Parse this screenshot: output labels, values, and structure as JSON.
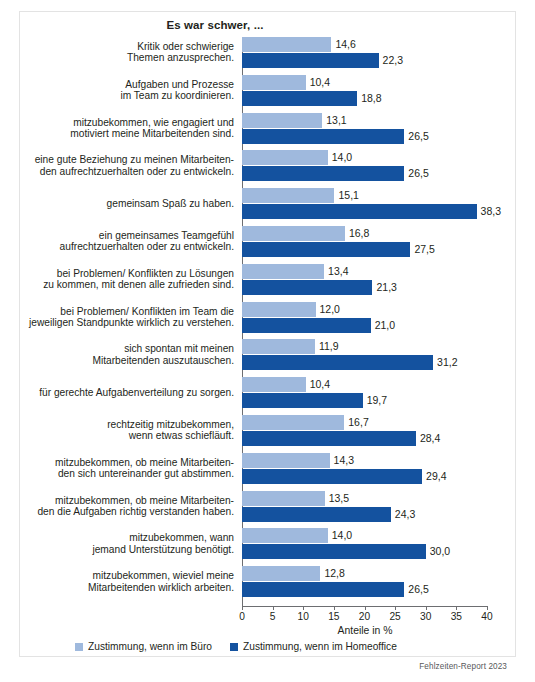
{
  "chart_data": {
    "type": "bar",
    "orientation": "horizontal",
    "title": "Es war schwer, ...",
    "xlabel": "Anteile in %",
    "ylabel": "",
    "xlim": [
      0,
      40
    ],
    "xticks": [
      0,
      5,
      10,
      15,
      20,
      25,
      30,
      35,
      40
    ],
    "grid": false,
    "legend_position": "bottom",
    "categories": [
      "Kritik oder schwierige\nThemen anzusprechen.",
      "Aufgaben und Prozesse\nim Team zu koordinieren.",
      "mitzubekommen, wie engagiert und\nmotiviert meine Mitarbeitenden sind.",
      "eine gute Beziehung zu meinen Mitarbeiten-\nden aufrechtzuerhalten oder zu entwickeln.",
      "gemeinsam Spaß zu haben.",
      "ein gemeinsames Teamgefühl\naufrechtzuerhalten oder zu entwickeln.",
      "bei Problemen/ Konflikten zu Lösungen\nzu kommen, mit denen alle zufrieden sind.",
      "bei Problemen/ Konflikten im Team die\njeweiligen Standpunkte wirklich zu verstehen.",
      "sich spontan mit meinen\nMitarbeitenden auszutauschen.",
      "für gerechte Aufgabenverteilung zu sorgen.",
      "rechtzeitig mitzubekommen,\nwenn etwas schiefläuft.",
      "mitzubekommen, ob meine Mitarbeiten-\nden sich untereinander gut abstimmen.",
      "mitzubekommen, ob meine Mitarbeiten-\nden die Aufgaben richtig verstanden haben.",
      "mitzubekommen, wann\njemand Unterstützung benötigt.",
      "mitzubekommen, wieviel meine\nMitarbeitenden wirklich arbeiten."
    ],
    "series": [
      {
        "name": "Zustimmung, wenn im Büro",
        "color": "#9fb9dd",
        "values": [
          14.6,
          10.4,
          13.1,
          14.0,
          15.1,
          16.8,
          13.4,
          12.0,
          11.9,
          10.4,
          16.7,
          14.3,
          13.5,
          14.0,
          12.8
        ],
        "labels": [
          "14,6",
          "10,4",
          "13,1",
          "14,0",
          "15,1",
          "16,8",
          "13,4",
          "12,0",
          "11,9",
          "10,4",
          "16,7",
          "14,3",
          "13,5",
          "14,0",
          "12,8"
        ]
      },
      {
        "name": "Zustimmung, wenn im Homeoffice",
        "color": "#14529f",
        "values": [
          22.3,
          18.8,
          26.5,
          26.5,
          38.3,
          27.5,
          21.3,
          21.0,
          31.2,
          19.7,
          28.4,
          29.4,
          24.3,
          30.0,
          26.5
        ],
        "labels": [
          "22,3",
          "18,8",
          "26,5",
          "26,5",
          "38,3",
          "27,5",
          "21,3",
          "21,0",
          "31,2",
          "19,7",
          "28,4",
          "29,4",
          "24,3",
          "30,0",
          "26,5"
        ]
      }
    ]
  },
  "legend": [
    {
      "label": "Zustimmung,  wenn im Büro",
      "swatch": "light"
    },
    {
      "label": "Zustimmung,  wenn im Homeoffice",
      "swatch": "dark"
    }
  ],
  "source": "Fehlzeiten-Report 2023"
}
